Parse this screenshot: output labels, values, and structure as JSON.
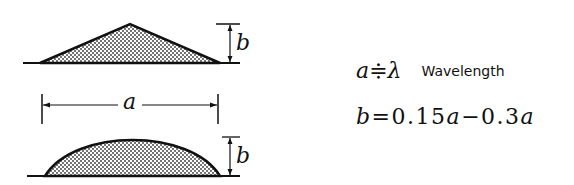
{
  "diagram": {
    "labels": {
      "width_symbol": "a",
      "height_symbol": "b"
    },
    "shapes": [
      {
        "name": "triangular-ripple",
        "profile": "triangle",
        "fill": "stippled"
      },
      {
        "name": "sinusoidal-ripple",
        "profile": "arch",
        "fill": "stippled"
      }
    ],
    "formulas": {
      "f1_lhs": "a",
      "f1_rel": "≑",
      "f1_rhs": "λ",
      "f1_word": "Wavelength",
      "f2_lhs": "b",
      "f2_eq": "=0.15",
      "f2_a1": "a",
      "f2_mid": "−0.3",
      "f2_a2": "a"
    }
  },
  "colors": {
    "ink": "#111111",
    "background": "#ffffff"
  }
}
